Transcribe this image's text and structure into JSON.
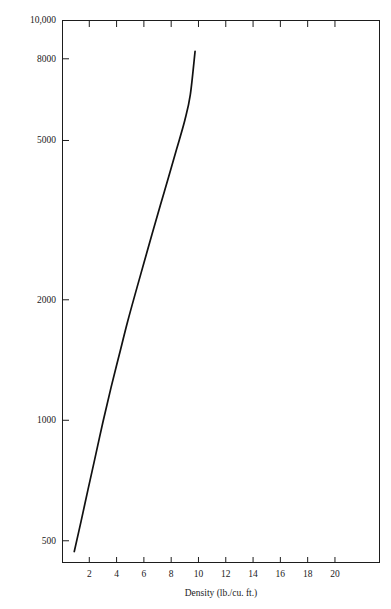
{
  "figure": {
    "clipped_header_text": "",
    "background_color": "#ffffff",
    "axis_color": "#1d1d1d",
    "curve_color": "#111111"
  },
  "chart_data": {
    "type": "line",
    "title": "",
    "xlabel": "Density (lb./cu. ft.)",
    "ylabel": "Modulus of elasticity in compression",
    "xlim": [
      0,
      23.3
    ],
    "ylim": [
      440,
      10000
    ],
    "yscale": "log",
    "xscale": "linear",
    "grid": false,
    "legend": null,
    "x_ticks": [
      2,
      4,
      6,
      8,
      10,
      12,
      14,
      16,
      18,
      20
    ],
    "x_tick_labels": [
      "2",
      "4",
      "6",
      "8",
      "10",
      "12",
      "14",
      "16",
      "18",
      "20"
    ],
    "y_ticks": [
      500,
      1000,
      2000,
      5000,
      8000,
      10000
    ],
    "y_tick_labels": [
      "500",
      "1000",
      "2000",
      "5000",
      "8000",
      "10,000"
    ],
    "series": [
      {
        "name": "Modulus of elasticity in compression",
        "x": [
          0.9,
          1.4,
          1.9,
          2.4,
          3.0,
          3.6,
          4.2,
          4.8,
          5.4,
          6.0,
          6.6,
          7.2,
          7.8,
          8.4,
          9.0,
          9.4,
          9.75
        ],
        "y": [
          470,
          560,
          670,
          800,
          990,
          1210,
          1460,
          1760,
          2090,
          2470,
          2920,
          3440,
          4040,
          4760,
          5620,
          6500,
          8350
        ]
      }
    ]
  },
  "axis_titles": {
    "x": "Density (lb./cu. ft.)",
    "y": "Modulus of elasticity in compression"
  }
}
